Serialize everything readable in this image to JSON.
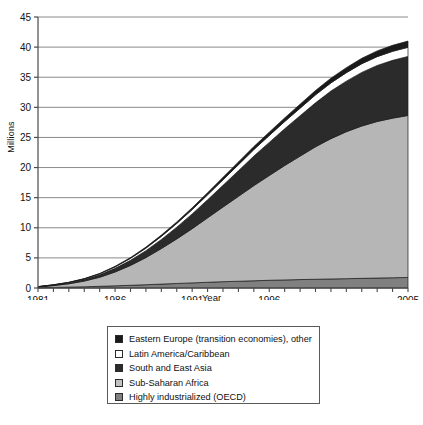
{
  "chart_data": {
    "type": "area",
    "title": "",
    "xlabel": "Year",
    "ylabel": "Millions",
    "xlim": [
      1981,
      2005
    ],
    "ylim": [
      0,
      45
    ],
    "ytick_step": 5,
    "grid": true,
    "stacked": true,
    "legend_position": "below-plot",
    "x": [
      1981,
      1982,
      1983,
      1984,
      1985,
      1986,
      1987,
      1988,
      1989,
      1990,
      1991,
      1992,
      1993,
      1994,
      1995,
      1996,
      1997,
      1998,
      1999,
      2000,
      2001,
      2002,
      2003,
      2004,
      2005
    ],
    "xticklabels": [
      "1981",
      "1986",
      "1991",
      "1996",
      "2005"
    ],
    "xticklabel_values": [
      1981,
      1986,
      1991,
      1996,
      2005
    ],
    "yticklabels": [
      "0",
      "5",
      "10",
      "15",
      "20",
      "25",
      "30",
      "35",
      "40",
      "45"
    ],
    "series": [
      {
        "name": "Highly industrialized (OECD)",
        "color": "#808080",
        "stack_order": 1,
        "values": [
          0.05,
          0.1,
          0.15,
          0.2,
          0.28,
          0.36,
          0.45,
          0.55,
          0.65,
          0.75,
          0.85,
          0.95,
          1.05,
          1.12,
          1.2,
          1.28,
          1.34,
          1.4,
          1.45,
          1.5,
          1.55,
          1.6,
          1.65,
          1.7,
          1.75
        ]
      },
      {
        "name": "Sub-Saharan Africa",
        "color": "#b6b6b6",
        "stack_order": 2,
        "values": [
          0.12,
          0.3,
          0.55,
          0.95,
          1.5,
          2.3,
          3.3,
          4.5,
          5.9,
          7.4,
          9.0,
          10.7,
          12.4,
          14.1,
          15.8,
          17.4,
          19.0,
          20.5,
          22.0,
          23.3,
          24.4,
          25.3,
          26.0,
          26.5,
          26.9
        ]
      },
      {
        "name": "South and East Asia",
        "color": "#2b2b2b",
        "stack_order": 3,
        "values": [
          0.03,
          0.08,
          0.15,
          0.25,
          0.4,
          0.6,
          0.85,
          1.15,
          1.5,
          1.95,
          2.45,
          3.0,
          3.6,
          4.25,
          4.9,
          5.5,
          6.1,
          6.7,
          7.3,
          7.9,
          8.4,
          8.9,
          9.3,
          9.6,
          9.8
        ]
      },
      {
        "name": "Latin America/Caribbean",
        "color": "#ffffff",
        "stack_order": 4,
        "values": [
          0.02,
          0.04,
          0.07,
          0.11,
          0.17,
          0.24,
          0.32,
          0.42,
          0.52,
          0.62,
          0.72,
          0.82,
          0.92,
          1.0,
          1.08,
          1.15,
          1.2,
          1.26,
          1.32,
          1.36,
          1.4,
          1.44,
          1.47,
          1.5,
          1.52
        ]
      },
      {
        "name": "Eastern Europe (transition economies), other",
        "color": "#1a1a1a",
        "stack_order": 5,
        "values": [
          0.01,
          0.02,
          0.03,
          0.05,
          0.07,
          0.1,
          0.13,
          0.17,
          0.21,
          0.25,
          0.3,
          0.35,
          0.4,
          0.45,
          0.5,
          0.55,
          0.6,
          0.66,
          0.72,
          0.78,
          0.84,
          0.9,
          0.95,
          1.0,
          1.03
        ]
      }
    ],
    "totals": [
      0.23,
      0.54,
      0.95,
      1.56,
      2.42,
      3.6,
      5.05,
      6.79,
      8.78,
      11.0,
      13.3,
      15.8,
      18.4,
      20.9,
      23.5,
      25.9,
      28.2,
      30.5,
      32.8,
      34.8,
      36.6,
      38.1,
      39.4,
      40.3,
      41.0
    ]
  },
  "legend": {
    "items": [
      {
        "label": "Eastern Europe (transition economies), other",
        "swatch": "#1a1a1a"
      },
      {
        "label": "Latin America/Caribbean",
        "swatch": "#ffffff"
      },
      {
        "label": "South and East Asia",
        "swatch": "#2b2b2b"
      },
      {
        "label": "Sub-Saharan Africa",
        "swatch": "#c2c2c2"
      },
      {
        "label": "Highly industrialized (OECD)",
        "swatch": "#808080"
      }
    ]
  }
}
